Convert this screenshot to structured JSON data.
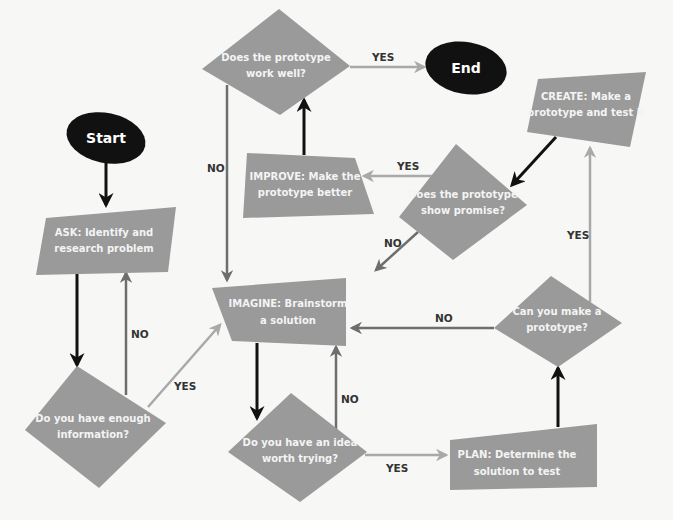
{
  "diagram": {
    "type": "flowchart",
    "colors": {
      "background": "#f7f7f5",
      "shape_fill": "#9a9a9a",
      "terminal_fill": "#111111",
      "main_arrow": "#111111",
      "yes_arrow": "#a9a9a9",
      "no_arrow": "#6e6e6e",
      "label_text": "#333333"
    },
    "nodes": {
      "start": {
        "label": "Start",
        "shape": "oval"
      },
      "end": {
        "label": "End",
        "shape": "oval"
      },
      "ask": {
        "line1": "ASK: Identify and",
        "line2": "research problem",
        "shape": "parallelogram"
      },
      "enough_info": {
        "line1": "Do you have enough",
        "line2": "information?",
        "shape": "diamond"
      },
      "imagine": {
        "line1": "IMAGINE: Brainstorm",
        "line2": "a solution",
        "shape": "parallelogram"
      },
      "idea_worth": {
        "line1": "Do you have an idea",
        "line2": "worth trying?",
        "shape": "diamond"
      },
      "plan": {
        "line1": "PLAN: Determine the",
        "line2": "solution to test",
        "shape": "parallelogram"
      },
      "can_make": {
        "line1": "Can you make a",
        "line2": "prototype?",
        "shape": "diamond"
      },
      "create": {
        "line1": "CREATE: Make a",
        "line2": "prototype and test it",
        "shape": "parallelogram"
      },
      "show_promise": {
        "line1": "Does the prototype",
        "line2": "show promise?",
        "shape": "diamond"
      },
      "improve": {
        "line1": "IMPROVE: Make the",
        "line2": "prototype better",
        "shape": "trapezoid"
      },
      "works_well": {
        "line1": "Does the prototype",
        "line2": "work well?",
        "shape": "diamond"
      }
    },
    "edges": [
      {
        "from": "start",
        "to": "ask",
        "label": ""
      },
      {
        "from": "ask",
        "to": "enough_info",
        "label": ""
      },
      {
        "from": "enough_info",
        "to": "ask",
        "label": "NO"
      },
      {
        "from": "enough_info",
        "to": "imagine",
        "label": "YES"
      },
      {
        "from": "imagine",
        "to": "idea_worth",
        "label": ""
      },
      {
        "from": "idea_worth",
        "to": "imagine",
        "label": "NO"
      },
      {
        "from": "idea_worth",
        "to": "plan",
        "label": "YES"
      },
      {
        "from": "plan",
        "to": "can_make",
        "label": ""
      },
      {
        "from": "can_make",
        "to": "imagine",
        "label": "NO"
      },
      {
        "from": "can_make",
        "to": "create",
        "label": "YES"
      },
      {
        "from": "create",
        "to": "show_promise",
        "label": ""
      },
      {
        "from": "show_promise",
        "to": "imagine",
        "label": "NO"
      },
      {
        "from": "show_promise",
        "to": "improve",
        "label": "YES"
      },
      {
        "from": "improve",
        "to": "works_well",
        "label": ""
      },
      {
        "from": "works_well",
        "to": "imagine",
        "label": "NO"
      },
      {
        "from": "works_well",
        "to": "end",
        "label": "YES"
      }
    ],
    "edge_labels": {
      "enough_info_no": "NO",
      "enough_info_yes": "YES",
      "idea_worth_no": "NO",
      "idea_worth_yes": "YES",
      "can_make_no": "NO",
      "can_make_yes": "YES",
      "show_promise_no": "NO",
      "show_promise_yes": "YES",
      "works_well_no": "NO",
      "works_well_yes": "YES"
    }
  }
}
